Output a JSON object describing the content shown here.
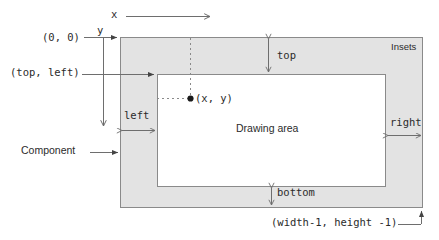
{
  "diagram": {
    "labels": {
      "x_axis": "x",
      "y_axis": "y",
      "origin": "(0, 0)",
      "top_left": "(top, left)",
      "point": "(x, y)",
      "inset_left": "left",
      "inset_top": "top",
      "inset_right": "right",
      "inset_bottom": "bottom",
      "insets_region": "Insets",
      "drawing_area": "Drawing area",
      "component": "Component",
      "bottom_right": "(width-1, height -1)"
    },
    "colors": {
      "stroke": "#777777",
      "text": "#2b2b2b",
      "insets_fill": "#e3e3e3",
      "drawing_fill": "#ffffff",
      "background": "#ffffff"
    },
    "geometry": {
      "component_box": {
        "x": 120,
        "y": 37,
        "width": 303,
        "height": 171
      },
      "drawing_box": {
        "x": 157,
        "y": 74,
        "width": 229,
        "height": 113
      },
      "point": {
        "x": 190,
        "y": 99
      }
    }
  }
}
